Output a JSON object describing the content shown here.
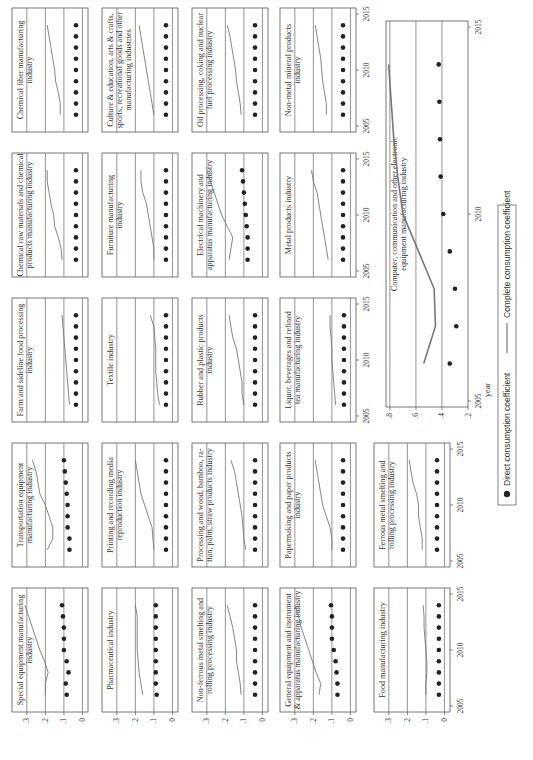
{
  "chart_data": {
    "type": "scatter",
    "xlabel": "year",
    "x_ticks": [
      2005,
      2010,
      2015
    ],
    "x_range": [
      2005,
      2015
    ],
    "years": [
      2006,
      2007,
      2008,
      2009,
      2010,
      2011,
      2012,
      2013,
      2014
    ],
    "default_y_ticks": [
      ".3",
      ".2",
      ".1",
      "0"
    ],
    "default_ylim": [
      -0.03,
      0.38
    ],
    "legend": {
      "direct": "Direct consumption coefficient",
      "complete": "Complete consumption coefficient"
    },
    "panels": [
      {
        "row": 0,
        "col": 0,
        "title": [
          "Special equipment manufacturing",
          "industry"
        ],
        "direct": [
          0.085,
          0.09,
          0.075,
          0.085,
          0.1,
          0.1,
          0.1,
          0.105,
          0.11
        ],
        "complete": [
          0.2,
          0.2,
          0.185,
          0.205,
          0.23,
          0.25,
          0.27,
          0.29,
          0.31
        ]
      },
      {
        "row": 0,
        "col": 1,
        "title": [
          "Transportation equipment",
          "manufacturing industry"
        ],
        "direct": [
          0.07,
          0.07,
          0.08,
          0.08,
          0.08,
          0.085,
          0.09,
          0.095,
          0.1
        ],
        "complete": [
          0.19,
          0.16,
          0.16,
          0.18,
          0.2,
          0.23,
          0.24,
          0.25,
          0.27
        ]
      },
      {
        "row": 0,
        "col": 2,
        "title": [
          "Farm and sideline food processing",
          "industry"
        ],
        "direct": [
          0.035,
          0.035,
          0.035,
          0.035,
          0.035,
          0.035,
          0.035,
          0.035,
          0.035
        ],
        "complete": [
          0.07,
          0.075,
          0.08,
          0.085,
          0.09,
          0.095,
          0.1,
          0.105,
          0.11
        ]
      },
      {
        "row": 0,
        "col": 3,
        "title": [
          "Chemical raw materials and chemical",
          "products manufacturing industry"
        ],
        "direct": [
          0.035,
          0.035,
          0.035,
          0.035,
          0.035,
          0.035,
          0.035,
          0.035,
          0.035
        ],
        "complete": [
          0.11,
          0.115,
          0.13,
          0.15,
          0.155,
          0.17,
          0.18,
          0.19,
          0.19
        ]
      },
      {
        "row": 0,
        "col": 4,
        "title": [
          "Chemical fiber manufacturing",
          "industry"
        ],
        "direct": [
          0.035,
          0.035,
          0.035,
          0.035,
          0.035,
          0.035,
          0.035,
          0.035,
          0.035
        ],
        "complete": [
          0.12,
          0.12,
          0.13,
          0.145,
          0.15,
          0.16,
          0.17,
          0.18,
          0.19
        ]
      },
      {
        "row": 1,
        "col": 0,
        "title": [
          "Pharmaceutical industry"
        ],
        "direct": [
          0.085,
          0.09,
          0.09,
          0.09,
          0.09,
          0.09,
          0.09,
          0.09,
          0.09
        ],
        "complete": [
          0.16,
          0.17,
          0.18,
          0.185,
          0.19,
          0.19,
          0.19,
          0.19,
          0.2
        ]
      },
      {
        "row": 1,
        "col": 1,
        "title": [
          "Printing and recording media",
          "reproduction industry"
        ],
        "direct": [
          0.035,
          0.035,
          0.035,
          0.035,
          0.035,
          0.035,
          0.035,
          0.035,
          0.035
        ],
        "complete": [
          0.1,
          0.105,
          0.11,
          0.13,
          0.15,
          0.17,
          0.18,
          0.19,
          0.2
        ]
      },
      {
        "row": 1,
        "col": 2,
        "title": [
          "Textile industry"
        ],
        "direct": [
          0.035,
          0.035,
          0.035,
          0.035,
          0.035,
          0.035,
          0.035,
          0.035,
          0.035
        ],
        "complete": [
          0.07,
          0.08,
          0.085,
          0.09,
          0.09,
          0.09,
          0.095,
          0.1,
          0.12
        ]
      },
      {
        "row": 1,
        "col": 3,
        "title": [
          "Furniture manufacturing",
          "industry"
        ],
        "direct": [
          0.035,
          0.035,
          0.035,
          0.035,
          0.035,
          0.035,
          0.035,
          0.035,
          0.035
        ],
        "complete": [
          0.1,
          0.1,
          0.11,
          0.12,
          0.13,
          0.14,
          0.16,
          0.17,
          0.17
        ]
      },
      {
        "row": 1,
        "col": 4,
        "title": [
          "Culture & education, arts & crafts,",
          "sports, recreational goods and other",
          "manufacturing industries"
        ],
        "direct": [
          0.035,
          0.035,
          0.035,
          0.035,
          0.035,
          0.035,
          0.035,
          0.035,
          0.035
        ],
        "complete": [
          0.1,
          0.11,
          0.12,
          0.13,
          0.14,
          0.15,
          0.16,
          0.17,
          0.18
        ]
      },
      {
        "row": 2,
        "col": 0,
        "title": [
          "Non-ferrous metal smelting and",
          "rolling processing industry"
        ],
        "direct": [
          0.04,
          0.04,
          0.04,
          0.04,
          0.04,
          0.04,
          0.04,
          0.04,
          0.04
        ],
        "complete": [
          0.115,
          0.12,
          0.13,
          0.14,
          0.14,
          0.15,
          0.16,
          0.175,
          0.19
        ]
      },
      {
        "row": 2,
        "col": 1,
        "title": [
          "Processing and wood, bamboo, ra-",
          "ttan, palm, straw products industry"
        ],
        "direct": [
          0.04,
          0.04,
          0.04,
          0.04,
          0.04,
          0.04,
          0.04,
          0.04,
          0.04
        ],
        "complete": [
          0.09,
          0.1,
          0.105,
          0.11,
          0.12,
          0.13,
          0.14,
          0.15,
          0.17
        ]
      },
      {
        "row": 2,
        "col": 2,
        "title": [
          "Rubber and plastic products",
          "industry"
        ],
        "direct": [
          0.04,
          0.04,
          0.04,
          0.04,
          0.04,
          0.04,
          0.04,
          0.04,
          0.04
        ],
        "complete": [
          0.1,
          0.11,
          0.11,
          0.12,
          0.13,
          0.14,
          0.16,
          0.17,
          0.18
        ]
      },
      {
        "row": 2,
        "col": 3,
        "title": [
          "Electrical machinery and",
          "apparatus manufacturing industry"
        ],
        "direct": [
          0.08,
          0.08,
          0.08,
          0.085,
          0.09,
          0.095,
          0.1,
          0.105,
          0.11
        ],
        "complete": [
          0.18,
          0.17,
          0.16,
          0.19,
          0.22,
          0.24,
          0.26,
          0.28,
          0.3
        ]
      },
      {
        "row": 2,
        "col": 4,
        "title": [
          "Oil processing, coking and nuclear",
          "fuel processing industry"
        ],
        "direct": [
          0.04,
          0.04,
          0.04,
          0.04,
          0.04,
          0.04,
          0.04,
          0.04,
          0.04
        ],
        "complete": [
          0.115,
          0.12,
          0.13,
          0.14,
          0.145,
          0.155,
          0.165,
          0.175,
          0.19
        ]
      },
      {
        "row": 3,
        "col": 0,
        "title": [
          "General equipment and instrument",
          "& apparatus manufacturing industry"
        ],
        "direct": [
          0.07,
          0.07,
          0.075,
          0.08,
          0.09,
          0.1,
          0.1,
          0.1,
          0.105
        ],
        "complete": [
          0.17,
          0.16,
          0.185,
          0.205,
          0.225,
          0.245,
          0.265,
          0.28,
          0.3
        ]
      },
      {
        "row": 3,
        "col": 1,
        "title": [
          "Papermaking and paper products",
          "industry"
        ],
        "direct": [
          0.04,
          0.04,
          0.04,
          0.04,
          0.04,
          0.04,
          0.04,
          0.04,
          0.04
        ],
        "complete": [
          0.1,
          0.1,
          0.11,
          0.13,
          0.15,
          0.16,
          0.17,
          0.18,
          0.19
        ]
      },
      {
        "row": 3,
        "col": 2,
        "title": [
          "Liquor, beverages and refined",
          "tea manufacturing industry"
        ],
        "direct": [
          0.035,
          0.035,
          0.035,
          0.035,
          0.035,
          0.035,
          0.035,
          0.035,
          0.035
        ],
        "complete": [
          0.08,
          0.085,
          0.09,
          0.095,
          0.1,
          0.1,
          0.105,
          0.11,
          0.11
        ]
      },
      {
        "row": 3,
        "col": 3,
        "title": [
          "Metal products industry"
        ],
        "direct": [
          0.04,
          0.04,
          0.04,
          0.04,
          0.04,
          0.04,
          0.04,
          0.04,
          0.04
        ],
        "complete": [
          0.12,
          0.13,
          0.14,
          0.15,
          0.16,
          0.17,
          0.18,
          0.2,
          0.21
        ]
      },
      {
        "row": 3,
        "col": 4,
        "title": [
          "Non-metal mineral products",
          "industry"
        ],
        "direct": [
          0.04,
          0.04,
          0.04,
          0.04,
          0.04,
          0.04,
          0.04,
          0.04,
          0.04
        ],
        "complete": [
          0.13,
          0.13,
          0.14,
          0.15,
          0.155,
          0.16,
          0.17,
          0.18,
          0.19
        ]
      },
      {
        "row": 4,
        "col": 0,
        "title": [
          "Food manufacturing industry"
        ],
        "direct": [
          0.03,
          0.03,
          0.03,
          0.03,
          0.03,
          0.03,
          0.03,
          0.03,
          0.03
        ],
        "complete": [
          0.1,
          0.1,
          0.095,
          0.095,
          0.1,
          0.105,
          0.11,
          0.11,
          0.115
        ]
      },
      {
        "row": 4,
        "col": 1,
        "title": [
          "Ferrous metal smelting and",
          "rolling processing industry"
        ],
        "direct": [
          0.04,
          0.04,
          0.04,
          0.04,
          0.04,
          0.04,
          0.04,
          0.04,
          0.04
        ],
        "complete": [
          0.12,
          0.12,
          0.13,
          0.14,
          0.14,
          0.15,
          0.17,
          0.18,
          0.19
        ]
      }
    ],
    "computer_panel": {
      "title": [
        "Computer, communication and other electronic",
        "equipment manufacturing industry"
      ],
      "y_ticks": [
        ".8",
        ".6",
        ".4",
        ".2"
      ],
      "ylim": [
        0.2,
        0.83
      ],
      "years": [
        2006,
        2007,
        2008,
        2009,
        2010,
        2011,
        2012,
        2013,
        2014
      ],
      "direct": [
        0.34,
        0.29,
        0.3,
        0.34,
        0.39,
        0.41,
        0.415,
        0.42,
        0.425
      ],
      "complete": [
        0.54,
        0.45,
        0.46,
        0.58,
        0.7,
        0.74,
        0.77,
        0.79,
        0.81
      ]
    }
  }
}
